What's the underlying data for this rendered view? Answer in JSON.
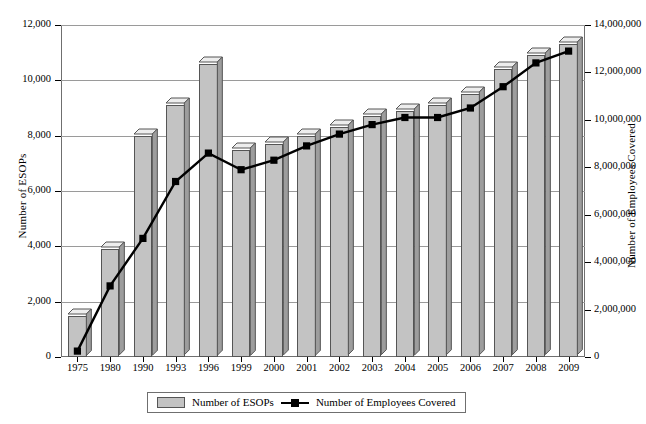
{
  "chart_data": {
    "type": "bar",
    "title": "",
    "xlabel": "",
    "ylabel": "Number of ESOPs",
    "y2label": "Number of Employees Covered",
    "grid": true,
    "legend_position": "bottom",
    "categories": [
      "1975",
      "1980",
      "1990",
      "1993",
      "1996",
      "1999",
      "2000",
      "2001",
      "2002",
      "2003",
      "2004",
      "2005",
      "2006",
      "2007",
      "2008",
      "2009"
    ],
    "ylim": [
      0,
      12000
    ],
    "y2lim": [
      0,
      14000000
    ],
    "yticks": [
      "0",
      "2,000",
      "4,000",
      "6,000",
      "8,000",
      "10,000",
      "12,000"
    ],
    "ytick_values": [
      0,
      2000,
      4000,
      6000,
      8000,
      10000,
      12000
    ],
    "y2ticks": [
      "0",
      "2,000,000",
      "4,000,000",
      "6,000,000",
      "8,000,000",
      "10,000,000",
      "12,000,000",
      "14,000,000"
    ],
    "y2tick_values": [
      0,
      2000000,
      4000000,
      6000000,
      8000000,
      10000000,
      12000000,
      14000000
    ],
    "series": [
      {
        "name": "Number of ESOPs",
        "type": "bar",
        "axis": "left",
        "color": "#c3c3c3",
        "values": [
          1500,
          3900,
          8000,
          9100,
          10600,
          7500,
          7700,
          8000,
          8300,
          8700,
          8900,
          9100,
          9500,
          10400,
          10900,
          11300
        ]
      },
      {
        "name": "Number of Employees Covered",
        "type": "line",
        "axis": "right",
        "color": "#000000",
        "values": [
          250000,
          3000000,
          5000000,
          7400000,
          8600000,
          7900000,
          8300000,
          8900000,
          9400000,
          9800000,
          10100000,
          10100000,
          10500000,
          11400000,
          12400000,
          12900000
        ]
      }
    ]
  },
  "legend": {
    "items": [
      {
        "label": "Number of ESOPs",
        "marker": "bar-swatch"
      },
      {
        "label": "Number of Employees Covered",
        "marker": "line-marker"
      }
    ]
  }
}
